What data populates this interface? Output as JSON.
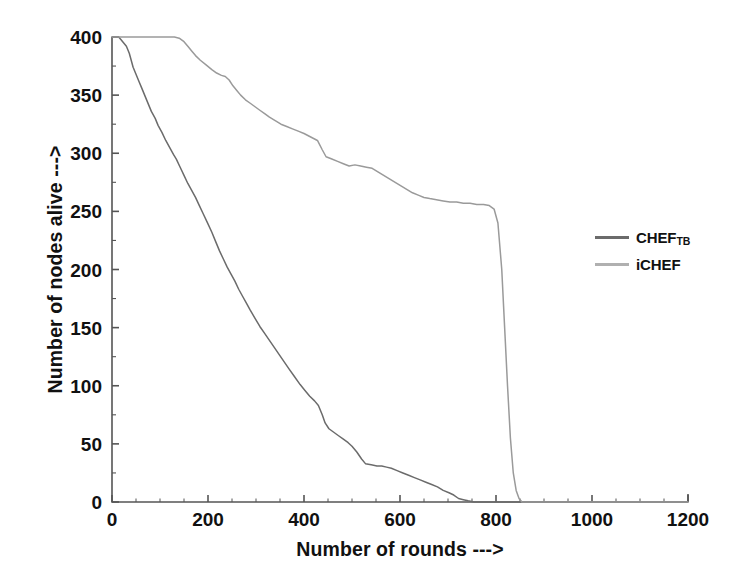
{
  "chart_data": {
    "type": "line",
    "title": "",
    "xlabel": "Number of rounds --->",
    "ylabel": "Number of nodes alive --->",
    "xlim": [
      0,
      1200
    ],
    "ylim": [
      0,
      400
    ],
    "xticks": [
      0,
      200,
      400,
      600,
      800,
      1000,
      1200
    ],
    "yticks": [
      0,
      50,
      100,
      150,
      200,
      250,
      300,
      350,
      400
    ],
    "xtick_labels": [
      "0",
      "200",
      "400",
      "600",
      "800",
      "1000",
      "1200"
    ],
    "ytick_labels": [
      "0",
      "50",
      "100",
      "150",
      "200",
      "250",
      "300",
      "350",
      "400"
    ],
    "grid": false,
    "legend_position": "right",
    "series": [
      {
        "name": "CHEF_TB",
        "label": "CHEF",
        "label_sub": "TB",
        "color": "#6b6b6b",
        "points": [
          [
            0,
            400
          ],
          [
            14,
            400
          ],
          [
            18,
            398
          ],
          [
            24,
            395
          ],
          [
            30,
            392
          ],
          [
            36,
            386
          ],
          [
            40,
            380
          ],
          [
            44,
            374
          ],
          [
            50,
            368
          ],
          [
            56,
            362
          ],
          [
            62,
            356
          ],
          [
            68,
            350
          ],
          [
            74,
            344
          ],
          [
            82,
            336
          ],
          [
            90,
            330
          ],
          [
            96,
            324
          ],
          [
            104,
            318
          ],
          [
            112,
            311
          ],
          [
            120,
            305
          ],
          [
            128,
            299
          ],
          [
            134,
            295
          ],
          [
            142,
            288
          ],
          [
            150,
            281
          ],
          [
            158,
            274
          ],
          [
            166,
            268
          ],
          [
            174,
            262
          ],
          [
            182,
            255
          ],
          [
            190,
            248
          ],
          [
            198,
            241
          ],
          [
            208,
            232
          ],
          [
            216,
            224
          ],
          [
            224,
            216
          ],
          [
            232,
            209
          ],
          [
            240,
            202
          ],
          [
            248,
            196
          ],
          [
            256,
            190
          ],
          [
            264,
            183
          ],
          [
            272,
            177
          ],
          [
            280,
            171
          ],
          [
            288,
            165
          ],
          [
            298,
            158
          ],
          [
            308,
            151
          ],
          [
            318,
            145
          ],
          [
            328,
            139
          ],
          [
            338,
            133
          ],
          [
            348,
            127
          ],
          [
            358,
            121
          ],
          [
            368,
            115
          ],
          [
            380,
            108
          ],
          [
            392,
            101
          ],
          [
            402,
            96
          ],
          [
            412,
            91
          ],
          [
            422,
            87
          ],
          [
            430,
            83
          ],
          [
            438,
            75
          ],
          [
            444,
            68
          ],
          [
            452,
            63
          ],
          [
            462,
            60
          ],
          [
            472,
            57
          ],
          [
            482,
            54
          ],
          [
            492,
            51
          ],
          [
            500,
            48
          ],
          [
            510,
            43
          ],
          [
            520,
            37
          ],
          [
            528,
            33
          ],
          [
            540,
            32
          ],
          [
            552,
            31
          ],
          [
            562,
            31
          ],
          [
            572,
            30
          ],
          [
            582,
            29
          ],
          [
            594,
            27
          ],
          [
            606,
            25
          ],
          [
            618,
            23
          ],
          [
            630,
            21
          ],
          [
            642,
            19
          ],
          [
            654,
            17
          ],
          [
            666,
            15
          ],
          [
            678,
            13
          ],
          [
            690,
            10
          ],
          [
            702,
            8
          ],
          [
            712,
            6
          ],
          [
            722,
            3
          ],
          [
            732,
            2
          ],
          [
            742,
            1
          ],
          [
            754,
            0
          ],
          [
            770,
            0
          ],
          [
            800,
            0
          ],
          [
            900,
            0
          ],
          [
            1000,
            0
          ],
          [
            1100,
            0
          ],
          [
            1200,
            0
          ]
        ]
      },
      {
        "name": "iCHEF",
        "label": "iCHEF",
        "color": "#9a9a9a",
        "points": [
          [
            0,
            400
          ],
          [
            40,
            400
          ],
          [
            80,
            400
          ],
          [
            110,
            400
          ],
          [
            130,
            400
          ],
          [
            140,
            399
          ],
          [
            150,
            396
          ],
          [
            158,
            392
          ],
          [
            166,
            388
          ],
          [
            174,
            384
          ],
          [
            184,
            380
          ],
          [
            196,
            376
          ],
          [
            208,
            372
          ],
          [
            218,
            369
          ],
          [
            228,
            367
          ],
          [
            236,
            366
          ],
          [
            244,
            363
          ],
          [
            252,
            358
          ],
          [
            260,
            354
          ],
          [
            268,
            350
          ],
          [
            278,
            346
          ],
          [
            288,
            343
          ],
          [
            298,
            340
          ],
          [
            308,
            337
          ],
          [
            318,
            334
          ],
          [
            328,
            331
          ],
          [
            340,
            328
          ],
          [
            352,
            325
          ],
          [
            364,
            323
          ],
          [
            376,
            321
          ],
          [
            388,
            319
          ],
          [
            400,
            317
          ],
          [
            414,
            314
          ],
          [
            428,
            311
          ],
          [
            438,
            303
          ],
          [
            446,
            297
          ],
          [
            458,
            295
          ],
          [
            470,
            293
          ],
          [
            482,
            291
          ],
          [
            494,
            289
          ],
          [
            506,
            290
          ],
          [
            518,
            289
          ],
          [
            530,
            288
          ],
          [
            542,
            287
          ],
          [
            554,
            284
          ],
          [
            566,
            281
          ],
          [
            578,
            278
          ],
          [
            590,
            275
          ],
          [
            602,
            272
          ],
          [
            614,
            269
          ],
          [
            626,
            266
          ],
          [
            638,
            264
          ],
          [
            650,
            262
          ],
          [
            662,
            261
          ],
          [
            676,
            260
          ],
          [
            690,
            259
          ],
          [
            704,
            258
          ],
          [
            718,
            258
          ],
          [
            732,
            257
          ],
          [
            746,
            257
          ],
          [
            760,
            256
          ],
          [
            774,
            256
          ],
          [
            786,
            255
          ],
          [
            796,
            252
          ],
          [
            804,
            240
          ],
          [
            812,
            200
          ],
          [
            818,
            150
          ],
          [
            824,
            100
          ],
          [
            830,
            55
          ],
          [
            836,
            25
          ],
          [
            842,
            10
          ],
          [
            848,
            3
          ],
          [
            854,
            0
          ],
          [
            866,
            0
          ],
          [
            900,
            0
          ],
          [
            1000,
            0
          ],
          [
            1100,
            0
          ],
          [
            1200,
            0
          ]
        ]
      }
    ]
  },
  "legend": {
    "items": [
      {
        "label": "CHEF",
        "sub": "TB",
        "color": "#6b6b6b"
      },
      {
        "label": "iCHEF",
        "sub": "",
        "color": "#b0b0b0"
      }
    ]
  },
  "axes": {
    "x_title": "Number of rounds --->",
    "y_title": "Number of nodes alive --->"
  }
}
